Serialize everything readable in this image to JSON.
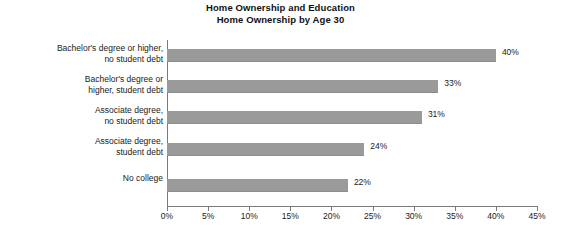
{
  "chart_data": {
    "type": "bar",
    "orientation": "horizontal",
    "title": "Home Ownership and Education",
    "subtitle": "Home Ownership by Age 30",
    "title_lines": [
      "Home Ownership and Education",
      "Home Ownership by Age 30"
    ],
    "xlabel": "",
    "ylabel": "",
    "categories": [
      "Bachelor's degree or higher,\nno student debt",
      "Bachelor's degree or\nhigher, student debt",
      "Associate degree,\nno student debt",
      "Associate degree,\nstudent debt",
      "No college"
    ],
    "values": [
      40,
      33,
      31,
      24,
      22
    ],
    "value_labels": [
      "40%",
      "33%",
      "31%",
      "24%",
      "22%"
    ],
    "xlim": [
      0,
      45
    ],
    "xticks": [
      0,
      5,
      10,
      15,
      20,
      25,
      30,
      35,
      40,
      45
    ],
    "xtick_labels": [
      "0%",
      "5%",
      "10%",
      "15%",
      "20%",
      "25%",
      "30%",
      "35%",
      "40%",
      "45%"
    ],
    "grid": false,
    "legend": null,
    "bar_color": "#9a9a9a",
    "axis_color": "#7a7a7a",
    "text_color": "#1a1a1a",
    "background": "#ffffff"
  }
}
